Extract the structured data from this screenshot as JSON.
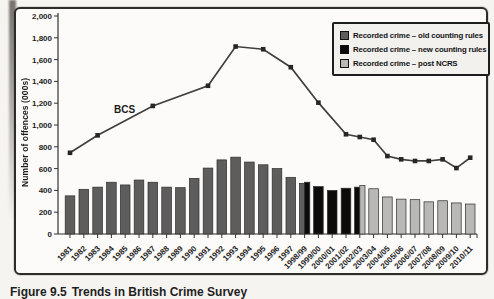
{
  "figure": {
    "caption_label": "Figure 9.5",
    "caption_text": "Trends in British Crime Survey"
  },
  "chart_data": {
    "type": "bar",
    "subtype": "composite bar + line, scanned book figure",
    "title": "",
    "xlabel": "",
    "ylabel": "Number of offences (000s)",
    "ylim": [
      0,
      2000
    ],
    "ytick_step": 200,
    "ytick_labels": [
      "2,000",
      "1,800",
      "1,600",
      "1,400",
      "1,200",
      "1,000",
      "800",
      "600",
      "400",
      "200",
      "0"
    ],
    "grid": false,
    "categories": [
      "1981",
      "1982",
      "1983",
      "1984",
      "1985",
      "1986",
      "1987",
      "1988",
      "1989",
      "1990",
      "1991",
      "1992",
      "1993",
      "1994",
      "1995",
      "1996",
      "1997",
      "1998/99",
      "1999/00",
      "2000/01",
      "2001/02",
      "2002/03",
      "2003/04",
      "2004/05",
      "2005/06",
      "2006/07",
      "2007/08",
      "2008/09",
      "2009/10",
      "2010/11"
    ],
    "bar_colors": {
      "old": "#5d5d5d",
      "new": "#0b0b0b",
      "post": "#b8b8b6"
    },
    "bars": [
      {
        "category": "1981",
        "segments": [
          {
            "rule": "old",
            "value": 350
          }
        ]
      },
      {
        "category": "1982",
        "segments": [
          {
            "rule": "old",
            "value": 410
          }
        ]
      },
      {
        "category": "1983",
        "segments": [
          {
            "rule": "old",
            "value": 430
          }
        ]
      },
      {
        "category": "1984",
        "segments": [
          {
            "rule": "old",
            "value": 475
          }
        ]
      },
      {
        "category": "1985",
        "segments": [
          {
            "rule": "old",
            "value": 450
          }
        ]
      },
      {
        "category": "1986",
        "segments": [
          {
            "rule": "old",
            "value": 495
          }
        ]
      },
      {
        "category": "1987",
        "segments": [
          {
            "rule": "old",
            "value": 475
          }
        ]
      },
      {
        "category": "1988",
        "segments": [
          {
            "rule": "old",
            "value": 430
          }
        ]
      },
      {
        "category": "1989",
        "segments": [
          {
            "rule": "old",
            "value": 425
          }
        ]
      },
      {
        "category": "1990",
        "segments": [
          {
            "rule": "old",
            "value": 510
          }
        ]
      },
      {
        "category": "1991",
        "segments": [
          {
            "rule": "old",
            "value": 605
          }
        ]
      },
      {
        "category": "1992",
        "segments": [
          {
            "rule": "old",
            "value": 680
          }
        ]
      },
      {
        "category": "1993",
        "segments": [
          {
            "rule": "old",
            "value": 705
          }
        ]
      },
      {
        "category": "1994",
        "segments": [
          {
            "rule": "old",
            "value": 660
          }
        ]
      },
      {
        "category": "1995",
        "segments": [
          {
            "rule": "old",
            "value": 635
          }
        ]
      },
      {
        "category": "1996",
        "segments": [
          {
            "rule": "old",
            "value": 600
          }
        ]
      },
      {
        "category": "1997",
        "segments": [
          {
            "rule": "old",
            "value": 520
          }
        ]
      },
      {
        "category": "1998/99",
        "segments": [
          {
            "rule": "old",
            "value": 465
          },
          {
            "rule": "new",
            "value": 475
          }
        ]
      },
      {
        "category": "1999/00",
        "segments": [
          {
            "rule": "new",
            "value": 435
          }
        ]
      },
      {
        "category": "2000/01",
        "segments": [
          {
            "rule": "new",
            "value": 400
          }
        ]
      },
      {
        "category": "2001/02",
        "segments": [
          {
            "rule": "new",
            "value": 420
          }
        ]
      },
      {
        "category": "2002/03",
        "segments": [
          {
            "rule": "new",
            "value": 430
          },
          {
            "rule": "post",
            "value": 445
          }
        ]
      },
      {
        "category": "2003/04",
        "segments": [
          {
            "rule": "post",
            "value": 415
          }
        ]
      },
      {
        "category": "2004/05",
        "segments": [
          {
            "rule": "post",
            "value": 340
          }
        ]
      },
      {
        "category": "2005/06",
        "segments": [
          {
            "rule": "post",
            "value": 320
          }
        ]
      },
      {
        "category": "2006/07",
        "segments": [
          {
            "rule": "post",
            "value": 315
          }
        ]
      },
      {
        "category": "2007/08",
        "segments": [
          {
            "rule": "post",
            "value": 295
          }
        ]
      },
      {
        "category": "2008/09",
        "segments": [
          {
            "rule": "post",
            "value": 305
          }
        ]
      },
      {
        "category": "2009/10",
        "segments": [
          {
            "rule": "post",
            "value": 285
          }
        ]
      },
      {
        "category": "2010/11",
        "segments": [
          {
            "rule": "post",
            "value": 275
          }
        ]
      }
    ],
    "line_series": {
      "name": "BCS",
      "annotation": "BCS",
      "color": "#3f3f3f",
      "marker": "square",
      "points": [
        {
          "category": "1981",
          "value": 745
        },
        {
          "category": "1983",
          "value": 905
        },
        {
          "category": "1987",
          "value": 1175
        },
        {
          "category": "1991",
          "value": 1360
        },
        {
          "category": "1993",
          "value": 1720
        },
        {
          "category": "1995",
          "value": 1695
        },
        {
          "category": "1997",
          "value": 1530
        },
        {
          "category": "1999/00",
          "value": 1205
        },
        {
          "category": "2001/02",
          "value": 915
        },
        {
          "category": "2002/03",
          "value": 890
        },
        {
          "category": "2003/04",
          "value": 865
        },
        {
          "category": "2004/05",
          "value": 715
        },
        {
          "category": "2005/06",
          "value": 685
        },
        {
          "category": "2006/07",
          "value": 670
        },
        {
          "category": "2007/08",
          "value": 670
        },
        {
          "category": "2008/09",
          "value": 685
        },
        {
          "category": "2009/10",
          "value": 605
        },
        {
          "category": "2010/11",
          "value": 700
        }
      ]
    },
    "legend": {
      "position": "top-right",
      "items": [
        {
          "label": "Recorded crime – old counting rules",
          "rule": "old",
          "color": "#5d5d5d"
        },
        {
          "label": "Recorded crime – new counting rules",
          "rule": "new",
          "color": "#0b0b0b"
        },
        {
          "label": "Recorded crime – post NCRS",
          "rule": "post",
          "color": "#b8b8b6"
        }
      ]
    }
  }
}
